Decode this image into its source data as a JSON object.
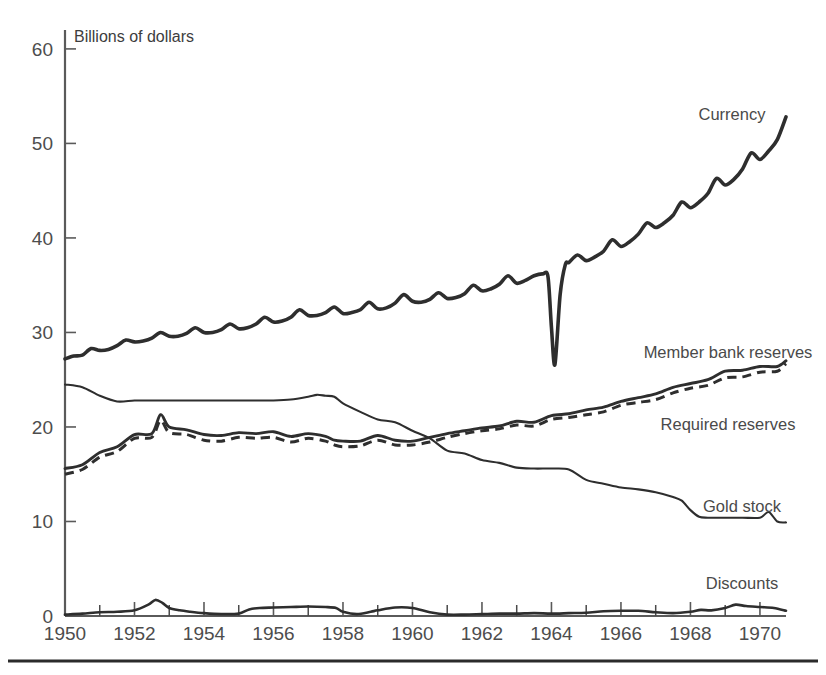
{
  "chart_data": {
    "type": "line",
    "title": "",
    "subtitle": "",
    "axis_note": "Billions of dollars",
    "xlabel": "",
    "ylabel": "Billions of dollars",
    "xlim": [
      1950,
      1970.75
    ],
    "ylim": [
      0,
      62
    ],
    "yticks": [
      0,
      10,
      20,
      30,
      40,
      50,
      60
    ],
    "ytick_labels": [
      "0",
      "10",
      "20",
      "30",
      "40",
      "50",
      "60"
    ],
    "xticks": [
      1950,
      1952,
      1954,
      1956,
      1958,
      1960,
      1962,
      1964,
      1966,
      1968,
      1970
    ],
    "xtick_labels": [
      "1950",
      "1952",
      "1954",
      "1956",
      "1958",
      "1960",
      "1962",
      "1964",
      "1966",
      "1968",
      "1970"
    ],
    "minor_xticks_every_years": 1,
    "grid": false,
    "legend_position": "inline-right-of-curves",
    "series": [
      {
        "name": "Currency",
        "label": "Currency",
        "style": "solid-thick",
        "color": "#2e2e2e",
        "x": [
          1950.0,
          1950.25,
          1950.5,
          1950.75,
          1951.0,
          1951.25,
          1951.5,
          1951.75,
          1952.0,
          1952.25,
          1952.5,
          1952.75,
          1953.0,
          1953.25,
          1953.5,
          1953.75,
          1954.0,
          1954.25,
          1954.5,
          1954.75,
          1955.0,
          1955.25,
          1955.5,
          1955.75,
          1956.0,
          1956.25,
          1956.5,
          1956.75,
          1957.0,
          1957.25,
          1957.5,
          1957.75,
          1958.0,
          1958.25,
          1958.5,
          1958.75,
          1959.0,
          1959.25,
          1959.5,
          1959.75,
          1960.0,
          1960.25,
          1960.5,
          1960.75,
          1961.0,
          1961.25,
          1961.5,
          1961.75,
          1962.0,
          1962.25,
          1962.5,
          1962.75,
          1963.0,
          1963.25,
          1963.5,
          1963.75,
          1963.9,
          1964.0,
          1964.1,
          1964.25,
          1964.4,
          1964.5,
          1964.75,
          1965.0,
          1965.25,
          1965.5,
          1965.75,
          1966.0,
          1966.25,
          1966.5,
          1966.75,
          1967.0,
          1967.25,
          1967.5,
          1967.75,
          1968.0,
          1968.25,
          1968.5,
          1968.75,
          1969.0,
          1969.25,
          1969.5,
          1969.75,
          1970.0,
          1970.25,
          1970.5,
          1970.75
        ],
        "y": [
          27.2,
          27.5,
          27.6,
          28.3,
          28.1,
          28.2,
          28.6,
          29.2,
          29.0,
          29.1,
          29.4,
          30.0,
          29.6,
          29.6,
          29.9,
          30.5,
          30.0,
          30.0,
          30.3,
          30.9,
          30.4,
          30.5,
          30.9,
          31.6,
          31.1,
          31.2,
          31.6,
          32.4,
          31.8,
          31.8,
          32.1,
          32.7,
          32.0,
          32.1,
          32.4,
          33.2,
          32.5,
          32.6,
          33.1,
          34.0,
          33.3,
          33.2,
          33.5,
          34.2,
          33.6,
          33.7,
          34.1,
          35.0,
          34.4,
          34.6,
          35.1,
          36.0,
          35.2,
          35.5,
          36.0,
          36.2,
          35.9,
          30.5,
          26.6,
          34.0,
          37.2,
          37.4,
          38.2,
          37.6,
          38.0,
          38.6,
          39.8,
          39.1,
          39.6,
          40.4,
          41.6,
          41.1,
          41.6,
          42.4,
          43.8,
          43.2,
          43.8,
          44.7,
          46.3,
          45.6,
          46.2,
          47.3,
          49.0,
          48.3,
          49.2,
          50.4,
          52.8
        ]
      },
      {
        "name": "Member bank reserves",
        "label": "Member bank reserves",
        "style": "solid",
        "color": "#2e2e2e",
        "x": [
          1950.0,
          1950.5,
          1951.0,
          1951.5,
          1952.0,
          1952.5,
          1952.75,
          1953.0,
          1953.5,
          1954.0,
          1954.5,
          1955.0,
          1955.5,
          1956.0,
          1956.5,
          1957.0,
          1957.5,
          1957.75,
          1958.0,
          1958.5,
          1959.0,
          1959.5,
          1960.0,
          1960.5,
          1961.0,
          1961.5,
          1962.0,
          1962.5,
          1963.0,
          1963.5,
          1964.0,
          1964.5,
          1965.0,
          1965.5,
          1966.0,
          1966.5,
          1967.0,
          1967.5,
          1968.0,
          1968.5,
          1969.0,
          1969.5,
          1970.0,
          1970.5,
          1970.75
        ],
        "y": [
          15.6,
          16.0,
          17.3,
          17.9,
          19.2,
          19.3,
          21.3,
          20.0,
          19.7,
          19.2,
          19.1,
          19.4,
          19.3,
          19.5,
          19.0,
          19.3,
          19.0,
          18.6,
          18.5,
          18.5,
          19.1,
          18.6,
          18.5,
          18.9,
          19.3,
          19.6,
          19.9,
          20.1,
          20.6,
          20.5,
          21.2,
          21.4,
          21.8,
          22.1,
          22.7,
          23.1,
          23.5,
          24.2,
          24.6,
          25.0,
          25.9,
          26.0,
          26.4,
          26.4,
          27.0
        ]
      },
      {
        "name": "Required reserves",
        "label": "Required reserves",
        "style": "dashed",
        "color": "#2e2e2e",
        "x": [
          1950.0,
          1950.5,
          1951.0,
          1951.5,
          1952.0,
          1952.5,
          1952.75,
          1953.0,
          1953.5,
          1954.0,
          1954.5,
          1955.0,
          1955.5,
          1956.0,
          1956.5,
          1957.0,
          1957.5,
          1957.75,
          1958.0,
          1958.5,
          1959.0,
          1959.5,
          1960.0,
          1960.5,
          1961.0,
          1961.5,
          1962.0,
          1962.5,
          1963.0,
          1963.5,
          1964.0,
          1964.5,
          1965.0,
          1965.5,
          1966.0,
          1966.5,
          1967.0,
          1967.5,
          1968.0,
          1968.5,
          1969.0,
          1969.5,
          1970.0,
          1970.5,
          1970.75
        ],
        "y": [
          15.0,
          15.5,
          16.8,
          17.4,
          18.8,
          18.9,
          20.7,
          19.4,
          19.2,
          18.6,
          18.5,
          18.9,
          18.8,
          18.9,
          18.4,
          18.8,
          18.5,
          18.1,
          17.9,
          18.0,
          18.6,
          18.1,
          18.1,
          18.4,
          18.9,
          19.3,
          19.6,
          19.8,
          20.2,
          20.1,
          20.8,
          21.0,
          21.3,
          21.6,
          22.3,
          22.6,
          22.9,
          23.6,
          24.1,
          24.4,
          25.2,
          25.3,
          25.8,
          25.9,
          26.7
        ]
      },
      {
        "name": "Gold stock",
        "label": "Gold stock",
        "style": "solid-thin",
        "color": "#2e2e2e",
        "x": [
          1950.0,
          1950.5,
          1951.0,
          1951.5,
          1952.0,
          1952.5,
          1953.0,
          1953.5,
          1954.0,
          1954.5,
          1955.0,
          1955.5,
          1956.0,
          1956.5,
          1957.0,
          1957.25,
          1957.5,
          1957.75,
          1958.0,
          1958.5,
          1959.0,
          1959.5,
          1960.0,
          1960.5,
          1961.0,
          1961.5,
          1962.0,
          1962.5,
          1963.0,
          1963.5,
          1964.0,
          1964.5,
          1965.0,
          1965.5,
          1966.0,
          1966.5,
          1967.0,
          1967.5,
          1967.75,
          1968.0,
          1968.25,
          1968.5,
          1969.0,
          1969.5,
          1970.0,
          1970.25,
          1970.5,
          1970.75
        ],
        "y": [
          24.5,
          24.2,
          23.3,
          22.7,
          22.8,
          22.8,
          22.8,
          22.8,
          22.8,
          22.8,
          22.8,
          22.8,
          22.8,
          22.9,
          23.2,
          23.4,
          23.3,
          23.2,
          22.5,
          21.6,
          20.8,
          20.5,
          19.6,
          18.8,
          17.5,
          17.2,
          16.5,
          16.2,
          15.7,
          15.6,
          15.6,
          15.5,
          14.4,
          14.0,
          13.6,
          13.4,
          13.1,
          12.6,
          12.2,
          11.2,
          10.5,
          10.4,
          10.4,
          10.4,
          10.4,
          11.0,
          10.0,
          9.9
        ]
      },
      {
        "name": "Discounts",
        "label": "Discounts",
        "style": "solid",
        "color": "#2e2e2e",
        "x": [
          1950.0,
          1950.5,
          1951.0,
          1951.5,
          1952.0,
          1952.4,
          1952.6,
          1952.8,
          1953.0,
          1953.3,
          1953.6,
          1954.0,
          1954.5,
          1955.0,
          1955.3,
          1955.6,
          1956.0,
          1956.5,
          1957.0,
          1957.5,
          1957.8,
          1958.0,
          1958.4,
          1958.8,
          1959.0,
          1959.5,
          1960.0,
          1960.5,
          1961.0,
          1961.5,
          1962.0,
          1962.5,
          1963.0,
          1963.5,
          1964.0,
          1964.5,
          1965.0,
          1965.5,
          1966.0,
          1966.5,
          1967.0,
          1967.5,
          1968.0,
          1968.3,
          1968.6,
          1969.0,
          1969.3,
          1969.6,
          1970.0,
          1970.4,
          1970.75
        ],
        "y": [
          0.15,
          0.25,
          0.4,
          0.45,
          0.6,
          1.2,
          1.7,
          1.4,
          0.85,
          0.6,
          0.45,
          0.3,
          0.2,
          0.25,
          0.7,
          0.85,
          0.9,
          0.95,
          1.0,
          0.95,
          0.85,
          0.45,
          0.2,
          0.45,
          0.6,
          0.9,
          0.85,
          0.4,
          0.15,
          0.15,
          0.2,
          0.25,
          0.25,
          0.3,
          0.25,
          0.3,
          0.35,
          0.5,
          0.55,
          0.55,
          0.4,
          0.3,
          0.45,
          0.65,
          0.6,
          0.85,
          1.2,
          1.05,
          0.95,
          0.85,
          0.55
        ]
      }
    ]
  },
  "labels": {
    "axis_note": "Billions of dollars",
    "currency": "Currency",
    "member_bank_reserves": "Member bank reserves",
    "required_reserves": "Required reserves",
    "gold_stock": "Gold stock",
    "discounts": "Discounts"
  },
  "yticks": [
    "60",
    "50",
    "40",
    "30",
    "20",
    "10",
    "0"
  ],
  "xticks": [
    "1950",
    "1952",
    "1954",
    "1956",
    "1958",
    "1960",
    "1962",
    "1964",
    "1966",
    "1968",
    "1970"
  ],
  "colors": {
    "ink": "#2e2e2e",
    "axis": "#5a5a5a",
    "text": "#4d4d4d",
    "background": "#ffffff"
  }
}
